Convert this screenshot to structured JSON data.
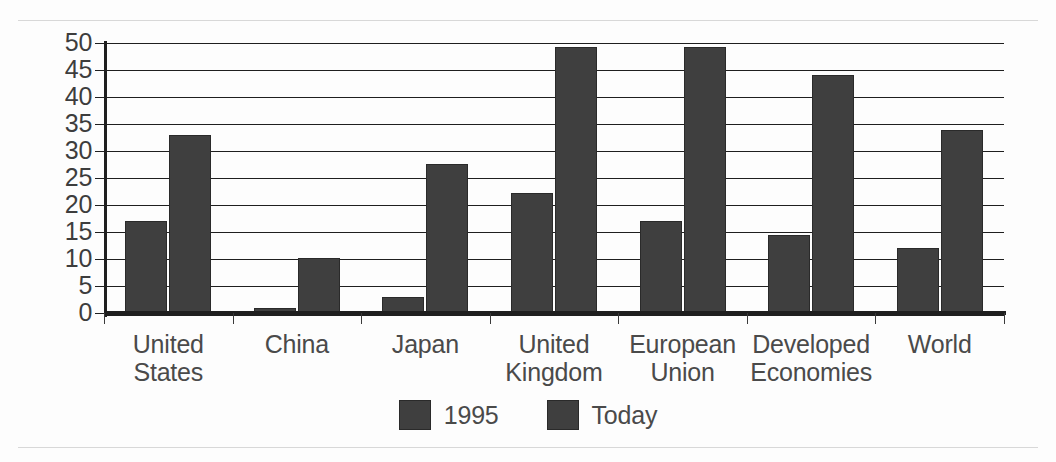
{
  "chart_data": {
    "type": "bar",
    "title": "",
    "subtitle": "",
    "xlabel": "",
    "ylabel": "",
    "ylim": [
      0,
      50
    ],
    "ytick_step": 5,
    "yticks": [
      "50",
      "45",
      "40",
      "35",
      "30",
      "25",
      "20",
      "15",
      "10",
      "5",
      "0"
    ],
    "grid": true,
    "legend_position": "bottom-center",
    "categories": [
      "United States",
      "China",
      "Japan",
      "United Kingdom",
      "European Union",
      "Developed Economies",
      "World"
    ],
    "category_label_lines": [
      [
        "United",
        "States"
      ],
      [
        "China",
        ""
      ],
      [
        "Japan",
        ""
      ],
      [
        "United",
        "Kingdom"
      ],
      [
        "European",
        "Union"
      ],
      [
        "Developed",
        "Economies"
      ],
      [
        "World",
        ""
      ]
    ],
    "series": [
      {
        "name": "1995",
        "color": "#3f3f3f",
        "values": [
          17,
          1,
          3,
          22.3,
          17,
          14.5,
          12
        ]
      },
      {
        "name": "Today",
        "color": "#3f3f3f",
        "values": [
          33,
          10.2,
          27.6,
          49.3,
          49.3,
          44.1,
          33.9
        ]
      }
    ]
  },
  "legend": {
    "entries": [
      {
        "label": "1995",
        "color": "#3f3f3f"
      },
      {
        "label": "Today",
        "color": "#3f3f3f"
      }
    ]
  },
  "colors": {
    "bar_fill": "#3f3f3f",
    "bar_stroke": "#2a2a2a",
    "gridline": "#1f1f1f",
    "axis": "#1f1f1f",
    "text": "#4a4a4a",
    "page_rule": "#d8d8d8",
    "background": "#fdfdfd"
  }
}
